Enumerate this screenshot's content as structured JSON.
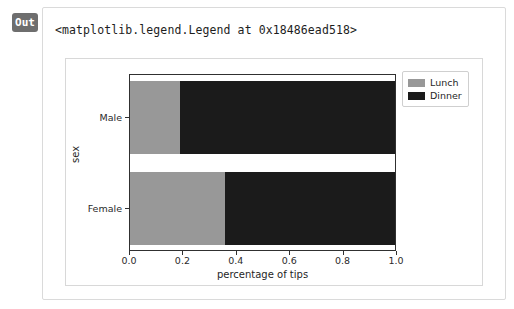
{
  "notebook": {
    "prompt_label": "Out",
    "repr_text": "<matplotlib.legend.Legend at 0x18486ead518>"
  },
  "colors": {
    "lunch": "#989898",
    "dinner": "#1b1b1b",
    "axis": "#303030",
    "card_border": "#dadada",
    "figure_border": "#d8d8d8",
    "prompt_badge": "#6e6e6e"
  },
  "chart_data": {
    "type": "bar",
    "orientation": "horizontal",
    "stacked": true,
    "normalized": true,
    "title": "",
    "xlabel": "percentage of tips",
    "ylabel": "sex",
    "categories": [
      "Male",
      "Female"
    ],
    "xlim": [
      0.0,
      1.0
    ],
    "xticks": [
      0.0,
      0.2,
      0.4,
      0.6,
      0.8,
      1.0
    ],
    "xticklabels": [
      "0.0",
      "0.2",
      "0.4",
      "0.6",
      "0.8",
      "1.0"
    ],
    "yticklabels": [
      "Male",
      "Female"
    ],
    "grid": false,
    "legend": {
      "position": "upper right (outside axes)",
      "entries": [
        {
          "label": "Lunch",
          "color": "#989898"
        },
        {
          "label": "Dinner",
          "color": "#1b1b1b"
        }
      ]
    },
    "series": [
      {
        "name": "Lunch",
        "values": [
          0.19,
          0.36
        ]
      },
      {
        "name": "Dinner",
        "values": [
          0.81,
          0.64
        ]
      }
    ]
  }
}
